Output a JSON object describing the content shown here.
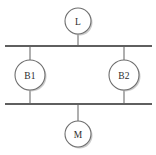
{
  "diagram": {
    "type": "single-line-block-diagram",
    "background_color": "#ffffff",
    "line_color": "#5f5f5f",
    "connector_color": "#7a7a7a",
    "node_stroke_color": "#6e6e6e",
    "node_fill_color": "#ffffff",
    "label_color": "#2b2b2b",
    "shadow_color": "#b9b9b9",
    "nodes": [
      {
        "id": "L",
        "label": "L",
        "cx": 78,
        "cy": 21,
        "r": 13
      },
      {
        "id": "B1",
        "label": "B1",
        "cx": 30,
        "cy": 75,
        "r": 15
      },
      {
        "id": "B2",
        "label": "B2",
        "cx": 124,
        "cy": 75,
        "r": 15
      },
      {
        "id": "M",
        "label": "M",
        "cx": 78,
        "cy": 134,
        "r": 13
      }
    ],
    "busbars": [
      {
        "id": "top-busbar",
        "x1": 5,
        "y1": 46,
        "x2": 152,
        "y2": 46
      },
      {
        "id": "bottom-busbar",
        "x1": 5,
        "y1": 104,
        "x2": 152,
        "y2": 104
      }
    ],
    "connectors": [
      {
        "id": "l-to-top-bus",
        "x1": 78,
        "y1": 34,
        "x2": 78,
        "y2": 46
      },
      {
        "id": "top-bus-to-b1",
        "x1": 30,
        "y1": 46,
        "x2": 30,
        "y2": 60
      },
      {
        "id": "b1-to-bottom-bus",
        "x1": 30,
        "y1": 90,
        "x2": 30,
        "y2": 104
      },
      {
        "id": "top-bus-to-b2",
        "x1": 124,
        "y1": 46,
        "x2": 124,
        "y2": 60
      },
      {
        "id": "b2-to-bottom-bus",
        "x1": 124,
        "y1": 90,
        "x2": 124,
        "y2": 104
      },
      {
        "id": "bottom-bus-to-m",
        "x1": 78,
        "y1": 104,
        "x2": 78,
        "y2": 121
      }
    ]
  }
}
